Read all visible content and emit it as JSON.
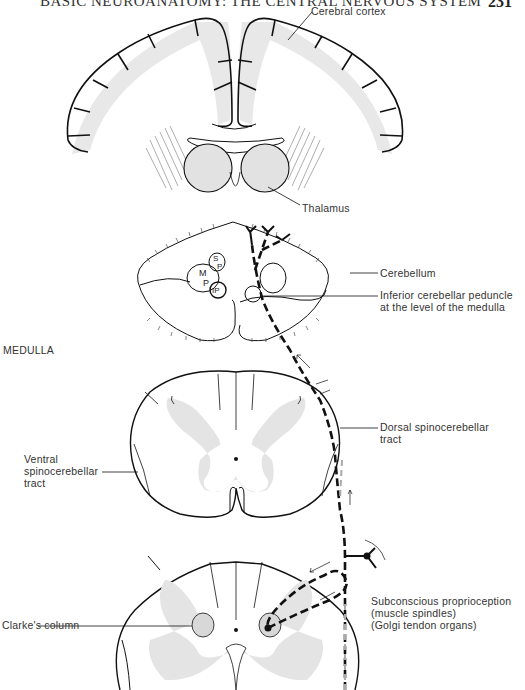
{
  "header": {
    "running_title": "BASIC NEUROANATOMY: THE CENTRAL NERVOUS SYSTEM",
    "page_number": "231"
  },
  "diagram": {
    "section_label": "MEDULLA",
    "structures": {
      "cerebral_cortex": "Cerebral cortex",
      "thalamus": "Thalamus",
      "cerebellum": "Cerebellum",
      "inferior_peduncle_line1": "Inferior cerebellar peduncle",
      "inferior_peduncle_line2": "at the level of the medulla",
      "dorsal_tract_line1": "Dorsal spinocerebellar",
      "dorsal_tract_line2": "tract",
      "ventral_tract_line1": "Ventral",
      "ventral_tract_line2": "spinocerebellar",
      "ventral_tract_line3": "tract",
      "clarkes_column": "Clarke's column",
      "proprioception_line1": "Subconscious proprioception",
      "proprioception_line2": "(muscle spindles)",
      "proprioception_line3": "(Golgi tendon organs)"
    },
    "nuclei_labels": {
      "mp_top": "M",
      "mp_bottom": "P",
      "sp_top": "S",
      "sp_bottom": "P",
      "ip": "IP"
    },
    "colors": {
      "line": "#111111",
      "gray_matter": "#e4e4e4",
      "tract_pathway": "#111111",
      "secondary_pathway": "#aaaaaa"
    }
  }
}
